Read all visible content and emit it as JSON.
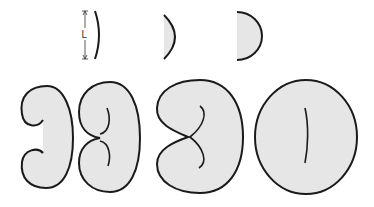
{
  "diagram": {
    "dimension_label": "L",
    "colors": {
      "fill": "#e6e6e6",
      "stroke": "#1a1a1a",
      "background": "#ffffff"
    },
    "top_row": [
      {
        "name": "thin-arc",
        "description": "shallow curved segment with length L"
      },
      {
        "name": "half-lens",
        "description": "deeper arc with flat left side"
      },
      {
        "name": "semicircle",
        "description": "half disk"
      }
    ],
    "bottom_row": [
      {
        "name": "hook-shape",
        "description": "closed shape with two inward hooks"
      },
      {
        "name": "pinched-shape",
        "description": "closed shape with two inner curls"
      },
      {
        "name": "notched-shape",
        "description": "kidney shape with single inner curve meeting notch"
      },
      {
        "name": "oval-shape",
        "description": "oval with single inner slit"
      }
    ]
  }
}
